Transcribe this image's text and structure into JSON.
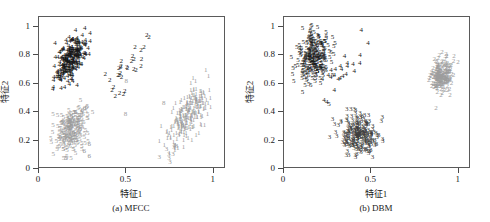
{
  "figure": {
    "panels": [
      {
        "id": "a",
        "caption": "(a) MFCC",
        "xlabel": "特征1",
        "ylabel": "特征2",
        "xticks": [
          "0",
          "0.5",
          "1"
        ],
        "xtickvals": [
          0,
          0.5,
          1
        ],
        "yticks": [
          "0",
          "0.2",
          "0.4",
          "0.6",
          "0.8",
          "1"
        ],
        "ytickvals": [
          0,
          0.2,
          0.4,
          0.6,
          0.8,
          1
        ]
      },
      {
        "id": "b",
        "caption": "(b) DBM",
        "xlabel": "特征1",
        "ylabel": "特征2",
        "xticks": [
          "0",
          "0.5",
          "1"
        ],
        "xtickvals": [
          0,
          0.5,
          1
        ],
        "yticks": [
          "0",
          "0.2",
          "0.4",
          "0.6",
          "0.8",
          "1"
        ],
        "ytickvals": [
          0,
          0.2,
          0.4,
          0.6,
          0.8,
          1
        ]
      }
    ]
  },
  "chart_data": [
    {
      "type": "scatter",
      "panel": "a",
      "title": "(a) MFCC",
      "xlabel": "特征1",
      "ylabel": "特征2",
      "xlim": [
        0,
        1.07
      ],
      "ylim": [
        0,
        1.07
      ],
      "grid": false,
      "legend": "none",
      "marker_style": "digit-glyph",
      "note": "Cluster membership is encoded as the printed digit at each point.",
      "series": [
        {
          "name": "4",
          "label": "4",
          "color": "#141414",
          "count": 240,
          "center": [
            0.185,
            0.775
          ],
          "spread": [
            0.042,
            0.085
          ],
          "correlation": 0.55
        },
        {
          "name": "5",
          "label": "5",
          "color": "#9a9a9a",
          "count": 215,
          "center": [
            0.185,
            0.275
          ],
          "spread": [
            0.048,
            0.08
          ],
          "correlation": 0.3
        },
        {
          "name": "6",
          "label": "6",
          "color": "#8e8e8e",
          "count": 8,
          "center": [
            0.265,
            0.255
          ],
          "spread": [
            0.045,
            0.115
          ],
          "correlation": 0.2
        },
        {
          "name": "2",
          "label": "2",
          "color": "#161616",
          "count": 30,
          "center": [
            0.495,
            0.7
          ],
          "spread": [
            0.065,
            0.135
          ],
          "correlation": 0.82
        },
        {
          "name": "1",
          "label": "1",
          "color": "#9c9c9c",
          "count": 230,
          "center": [
            0.855,
            0.38
          ],
          "spread": [
            0.06,
            0.095
          ],
          "correlation": 0.6
        },
        {
          "name": "3",
          "label": "3",
          "color": "#9c9c9c",
          "count": 10,
          "center": [
            0.76,
            0.12
          ],
          "spread": [
            0.04,
            0.045
          ],
          "correlation": 0.3
        },
        {
          "name": "8",
          "label": "8",
          "color": "#9c9c9c",
          "count": 3,
          "center": [
            0.5,
            0.45
          ],
          "spread": [
            0.15,
            0.18
          ],
          "correlation": 0.0
        }
      ]
    },
    {
      "type": "scatter",
      "panel": "b",
      "title": "(b) DBM",
      "xlabel": "特征1",
      "ylabel": "特征2",
      "xlim": [
        0,
        1.07
      ],
      "ylim": [
        0,
        1.07
      ],
      "grid": false,
      "legend": "none",
      "marker_style": "digit-glyph",
      "note": "Cluster membership is encoded as the printed digit at each point.",
      "series": [
        {
          "name": "5",
          "label": "5",
          "color": "#141414",
          "count": 250,
          "center": [
            0.165,
            0.79
          ],
          "spread": [
            0.045,
            0.09
          ],
          "correlation": 0.1
        },
        {
          "name": "4",
          "label": "4",
          "color": "#161616",
          "count": 24,
          "center": [
            0.315,
            0.69
          ],
          "spread": [
            0.075,
            0.105
          ],
          "correlation": 0.55
        },
        {
          "name": "3",
          "label": "3",
          "color": "#3c3c3c",
          "count": 250,
          "center": [
            0.43,
            0.25
          ],
          "spread": [
            0.055,
            0.07
          ],
          "correlation": -0.1
        },
        {
          "name": "2",
          "label": "2",
          "color": "#9c9c9c",
          "count": 210,
          "center": [
            0.9,
            0.665
          ],
          "spread": [
            0.035,
            0.06
          ],
          "correlation": 0.05
        }
      ]
    }
  ]
}
